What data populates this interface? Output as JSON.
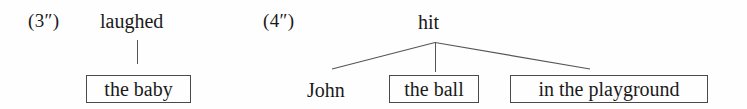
{
  "page": {
    "background_color": "#fefefe",
    "ink_color": "#1a1a1a",
    "line_color": "#555555"
  },
  "examples": [
    {
      "id": "example-3",
      "number_label": "(3″)",
      "head": "laughed",
      "children": [
        {
          "text": "the baby",
          "boxed": true
        }
      ]
    },
    {
      "id": "example-4",
      "number_label": "(4″)",
      "head": "hit",
      "children": [
        {
          "text": "John",
          "boxed": false
        },
        {
          "text": "the ball",
          "boxed": true
        },
        {
          "text": "in the playground",
          "boxed": true
        }
      ]
    }
  ]
}
